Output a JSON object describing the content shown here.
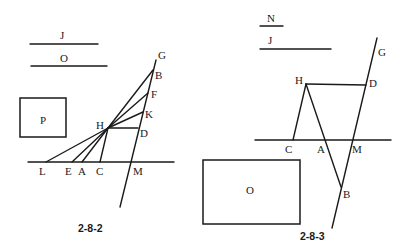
{
  "figures": [
    {
      "id": "2-8-2",
      "caption": "2-8-2",
      "segments_legend": [
        {
          "label": "J"
        },
        {
          "label": "O"
        }
      ],
      "box_label": "P",
      "points": {
        "G": "G",
        "B": "B",
        "F": "F",
        "K": "K",
        "H": "H",
        "D": "D",
        "L": "L",
        "E": "E",
        "A": "A",
        "C": "C",
        "M": "M"
      }
    },
    {
      "id": "2-8-3",
      "caption": "2-8-3",
      "segments_legend": [
        {
          "label": "N"
        },
        {
          "label": "J"
        }
      ],
      "box_label": "O",
      "points": {
        "G": "G",
        "H": "H",
        "D": "D",
        "C": "C",
        "A": "A",
        "M": "M",
        "B": "B"
      }
    }
  ]
}
